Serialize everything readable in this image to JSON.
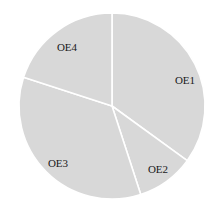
{
  "chart_data": {
    "type": "pie",
    "title": "",
    "categories": [
      "OE1",
      "OE2",
      "OE3",
      "OE4"
    ],
    "values": [
      35,
      10,
      35,
      20
    ],
    "start_angle": "12 o'clock",
    "direction": "clockwise",
    "legend": "none",
    "labels_inside": true,
    "colors": [
      "#d8d8d8",
      "#d8d8d8",
      "#d8d8d8",
      "#d8d8d8"
    ],
    "separator_color": "#ffffff"
  },
  "labels": {
    "oe1": "OE1",
    "oe2": "OE2",
    "oe3": "OE3",
    "oe4": "OE4"
  }
}
